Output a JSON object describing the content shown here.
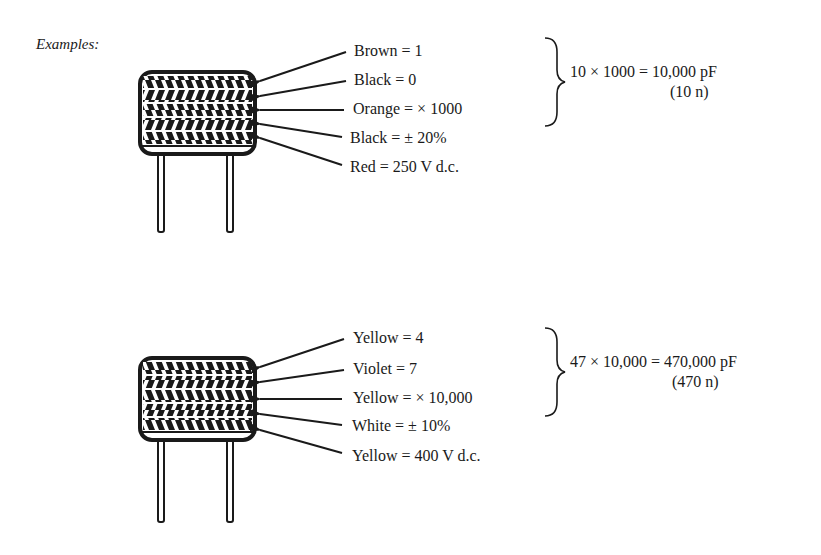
{
  "heading": "Examples:",
  "examples": [
    {
      "bands": [
        {
          "label": "Brown = 1"
        },
        {
          "label": "Black = 0"
        },
        {
          "label": "Orange = × 1000"
        },
        {
          "label": "Black = ± 20%"
        },
        {
          "label": "Red = 250 V d.c."
        }
      ],
      "result": "10 × 1000 = 10,000 pF",
      "result_short": "(10 n)"
    },
    {
      "bands": [
        {
          "label": "Yellow = 4"
        },
        {
          "label": "Violet = 7"
        },
        {
          "label": "Yellow = × 10,000"
        },
        {
          "label": "White = ± 10%"
        },
        {
          "label": "Yellow = 400 V d.c."
        }
      ],
      "result": "47 × 10,000 = 470,000 pF",
      "result_short": "(470 n)"
    }
  ],
  "colors": {
    "ink": "#1a1a1a",
    "paper": "#ffffff"
  }
}
